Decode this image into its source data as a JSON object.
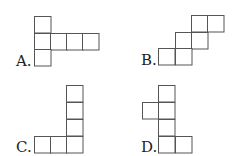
{
  "figures": [
    {
      "label": "A.",
      "label_pos": [
        16,
        66
      ],
      "cells": [
        [
          34,
          16
        ],
        [
          34,
          33
        ],
        [
          50,
          33
        ],
        [
          66,
          33
        ],
        [
          82,
          33
        ],
        [
          34,
          49
        ]
      ]
    },
    {
      "label": "B.",
      "label_pos": [
        141,
        65
      ],
      "cells": [
        [
          191,
          15
        ],
        [
          207,
          15
        ],
        [
          175,
          32
        ],
        [
          191,
          32
        ],
        [
          158,
          48
        ],
        [
          175,
          48
        ]
      ]
    },
    {
      "label": "C.",
      "label_pos": [
        16,
        152
      ],
      "cells": [
        [
          66,
          85
        ],
        [
          66,
          102
        ],
        [
          66,
          119
        ],
        [
          34,
          136
        ],
        [
          50,
          136
        ],
        [
          66,
          136
        ]
      ]
    },
    {
      "label": "D.",
      "label_pos": [
        141,
        152
      ],
      "cells": [
        [
          158,
          85
        ],
        [
          142,
          102
        ],
        [
          158,
          102
        ],
        [
          158,
          119
        ],
        [
          158,
          136
        ],
        [
          175,
          136
        ]
      ]
    }
  ],
  "style": {
    "cell_size": 16.5,
    "stroke_color": "#555555",
    "text_color": "#222222"
  }
}
